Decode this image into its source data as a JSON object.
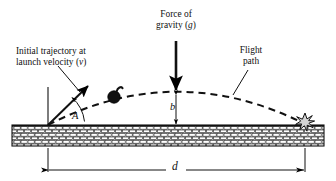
{
  "diagram": {
    "type": "physics-projectile-motion",
    "background_color": "#ffffff",
    "ink_color": "#000000"
  },
  "labels": {
    "initial_trajectory_line1": "Initial trajectory at",
    "initial_trajectory_line2_pre": "launch velocity (",
    "initial_trajectory_line2_sym": "v",
    "initial_trajectory_line2_post": ")",
    "force_of_gravity_line1": "Force of",
    "force_of_gravity_line2_pre": "gravity (",
    "force_of_gravity_line2_sym": "g",
    "force_of_gravity_line2_post": ")",
    "flight_path_line1": "Flight",
    "flight_path_line2": "path",
    "angle_symbol": "A",
    "height_symbol": "b",
    "distance_symbol": "d"
  },
  "elements": {
    "ground_label": "brick ground band",
    "projectile_label": "bomb projectile",
    "impact_label": "impact burst",
    "velocity_arrow_label": "initial velocity vector",
    "gravity_arrow_label": "gravity force vector",
    "trajectory_label": "dashed parabolic flight path",
    "height_dimension_label": "apex height dimension",
    "distance_dimension_label": "range dimension"
  },
  "geometry": {
    "launch_x": 48,
    "launch_y": 125,
    "apex_x": 176,
    "apex_y": 92,
    "impact_x": 305,
    "impact_y": 124,
    "ground_top": 125,
    "ground_bottom": 146,
    "dimension_line_y": 170,
    "launch_angle_degrees": 45
  }
}
